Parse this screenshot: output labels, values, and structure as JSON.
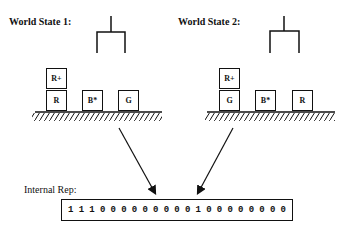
{
  "world_states": [
    {
      "title": "World State 1:",
      "stack": [
        "R+",
        "R"
      ],
      "blocks": [
        "B*",
        "G"
      ]
    },
    {
      "title": "World State 2:",
      "stack": [
        "R+",
        "G"
      ],
      "blocks": [
        "B*",
        "R"
      ]
    }
  ],
  "internal_rep": {
    "label": "Internal Rep:",
    "bits": [
      "1",
      "1",
      "1",
      "0",
      "0",
      "0",
      "0",
      "0",
      "0",
      "0",
      "0",
      "0",
      "1",
      "0",
      "0",
      "0",
      "0",
      "0",
      "0",
      "0",
      "0"
    ]
  }
}
